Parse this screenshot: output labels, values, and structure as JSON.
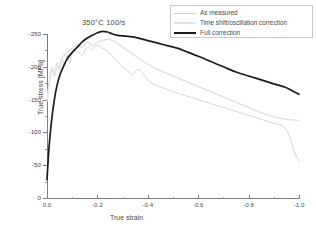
{
  "chart_data": {
    "type": "line",
    "title": "350°C 100/s",
    "xlabel": "True strain",
    "ylabel": "True stress [MPa]",
    "xlim": [
      0.0,
      -1.0
    ],
    "ylim": [
      0,
      -250
    ],
    "xticks": [
      "0.0",
      "-0.2",
      "-0.4",
      "-0.6",
      "-0.8",
      "-1.0"
    ],
    "yticks": [
      "0",
      "-50",
      "-100",
      "-150",
      "-200",
      "-250"
    ],
    "grid": false,
    "legend_position": "top-right",
    "series": [
      {
        "name": "As measured",
        "color": "#cfcfcf",
        "x": [
          0.0,
          -0.01,
          -0.02,
          -0.03,
          -0.04,
          -0.05,
          -0.06,
          -0.07,
          -0.08,
          -0.09,
          -0.1,
          -0.12,
          -0.14,
          -0.16,
          -0.18,
          -0.2,
          -0.22,
          -0.24,
          -0.26,
          -0.28,
          -0.3,
          -0.32,
          -0.34,
          -0.36,
          -0.38,
          -0.4,
          -0.43,
          -0.46,
          -0.5,
          -0.55,
          -0.6,
          -0.65,
          -0.7,
          -0.75,
          -0.8,
          -0.85,
          -0.88,
          -0.9,
          -0.92,
          -0.94,
          -0.96,
          -0.98,
          -1.0
        ],
        "y": [
          -150,
          -178,
          -196,
          -186,
          -205,
          -196,
          -212,
          -200,
          -218,
          -206,
          -221,
          -224,
          -218,
          -230,
          -226,
          -233,
          -228,
          -224,
          -216,
          -208,
          -200,
          -194,
          -188,
          -196,
          -190,
          -180,
          -172,
          -168,
          -162,
          -156,
          -150,
          -144,
          -138,
          -132,
          -126,
          -120,
          -116,
          -114,
          -112,
          -108,
          -96,
          -72,
          -56
        ]
      },
      {
        "name": "Time shift/oscillation correction",
        "color": "#e2e2e2",
        "x": [
          0.0,
          -0.01,
          -0.02,
          -0.03,
          -0.04,
          -0.05,
          -0.06,
          -0.08,
          -0.1,
          -0.12,
          -0.14,
          -0.16,
          -0.18,
          -0.2,
          -0.22,
          -0.24,
          -0.26,
          -0.28,
          -0.3,
          -0.33,
          -0.36,
          -0.4,
          -0.45,
          -0.5,
          -0.55,
          -0.6,
          -0.65,
          -0.7,
          -0.75,
          -0.8,
          -0.85,
          -0.9,
          -0.95,
          -1.0
        ],
        "y": [
          -148,
          -180,
          -198,
          -188,
          -206,
          -198,
          -214,
          -222,
          -228,
          -234,
          -230,
          -238,
          -232,
          -238,
          -240,
          -242,
          -240,
          -236,
          -230,
          -222,
          -214,
          -204,
          -194,
          -186,
          -178,
          -170,
          -162,
          -154,
          -146,
          -138,
          -130,
          -124,
          -120,
          -118
        ]
      },
      {
        "name": "Full correction",
        "color": "#1c1c1c",
        "x": [
          0.0,
          -0.005,
          -0.01,
          -0.02,
          -0.03,
          -0.04,
          -0.05,
          -0.06,
          -0.08,
          -0.1,
          -0.12,
          -0.14,
          -0.16,
          -0.18,
          -0.2,
          -0.22,
          -0.24,
          -0.26,
          -0.28,
          -0.3,
          -0.33,
          -0.36,
          -0.4,
          -0.44,
          -0.48,
          -0.52,
          -0.56,
          -0.6,
          -0.65,
          -0.7,
          -0.75,
          -0.8,
          -0.85,
          -0.9,
          -0.95,
          -0.98,
          -1.0
        ],
        "y": [
          -28,
          -60,
          -86,
          -124,
          -152,
          -172,
          -186,
          -196,
          -212,
          -222,
          -230,
          -238,
          -244,
          -248,
          -252,
          -254,
          -253,
          -250,
          -248,
          -247,
          -246,
          -244,
          -240,
          -236,
          -232,
          -228,
          -222,
          -216,
          -208,
          -200,
          -192,
          -186,
          -180,
          -174,
          -168,
          -162,
          -158
        ]
      }
    ]
  }
}
